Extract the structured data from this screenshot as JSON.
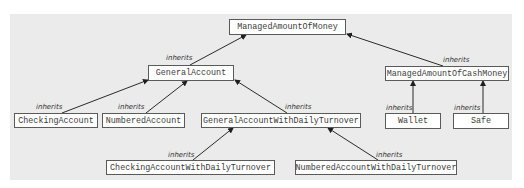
{
  "diagram": {
    "type": "class-inheritance",
    "nodes": [
      {
        "id": "managed_amount_of_money",
        "label": "ManagedAmountOfMoney"
      },
      {
        "id": "general_account",
        "label": "GeneralAccount"
      },
      {
        "id": "managed_amount_of_cash_money",
        "label": "ManagedAmountOfCashMoney"
      },
      {
        "id": "checking_account",
        "label": "CheckingAccount"
      },
      {
        "id": "numbered_account",
        "label": "NumberedAccount"
      },
      {
        "id": "general_account_with_daily_turnover",
        "label": "GeneralAccountWithDailyTurnover"
      },
      {
        "id": "wallet",
        "label": "Wallet"
      },
      {
        "id": "safe",
        "label": "Safe"
      },
      {
        "id": "checking_account_with_daily_turnover",
        "label": "CheckingAccountWithDailyTurnover"
      },
      {
        "id": "numbered_account_with_daily_turnover",
        "label": "NumberedAccountWithDailyTurnover"
      }
    ],
    "edges": [
      {
        "from": "general_account",
        "to": "managed_amount_of_money",
        "label": "inherits"
      },
      {
        "from": "managed_amount_of_cash_money",
        "to": "managed_amount_of_money",
        "label": "inherits"
      },
      {
        "from": "checking_account",
        "to": "general_account",
        "label": "inherits"
      },
      {
        "from": "numbered_account",
        "to": "general_account",
        "label": "inherits"
      },
      {
        "from": "general_account_with_daily_turnover",
        "to": "general_account",
        "label": "inherits"
      },
      {
        "from": "wallet",
        "to": "managed_amount_of_cash_money",
        "label": "inherits"
      },
      {
        "from": "safe",
        "to": "managed_amount_of_cash_money",
        "label": "inherits"
      },
      {
        "from": "checking_account_with_daily_turnover",
        "to": "general_account_with_daily_turnover",
        "label": "inherits"
      },
      {
        "from": "numbered_account_with_daily_turnover",
        "to": "general_account_with_daily_turnover",
        "label": "inherits"
      }
    ]
  },
  "colors": {
    "panel_background": "#ebebeb",
    "node_fill": "#ffffff",
    "node_border": "#5a5a5a",
    "edge": "#2a2a2a"
  }
}
